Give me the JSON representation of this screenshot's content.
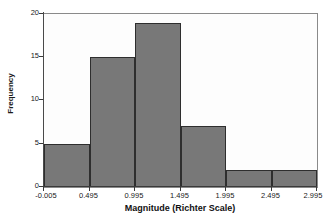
{
  "chart_data": {
    "type": "bar",
    "title": "",
    "xlabel": "Magnitude (Richter Scale)",
    "ylabel": "Frequency",
    "categories": [
      "-0.005 to 0.495",
      "0.495 to 0.995",
      "0.995 to 1.495",
      "1.495 to 1.995",
      "1.995 to 2.495",
      "2.495 to 2.995"
    ],
    "values": [
      5,
      15,
      19,
      7,
      2,
      2
    ],
    "bin_edges": [
      -0.005,
      0.495,
      0.995,
      1.495,
      1.995,
      2.495,
      2.995
    ],
    "bin_width": 0.5,
    "xlim": [
      -0.005,
      2.995
    ],
    "ylim": [
      0,
      20
    ],
    "x_tick_labels": [
      "-0.005",
      "0.495",
      "0.995",
      "1.495",
      "1.995",
      "2.495",
      "2.995"
    ],
    "x_tick_values": [
      -0.005,
      0.495,
      0.995,
      1.495,
      1.995,
      2.495,
      2.995
    ],
    "y_tick_labels": [
      "0",
      "5",
      "10",
      "15",
      "20"
    ],
    "y_tick_values": [
      0,
      5,
      10,
      15,
      20
    ],
    "grid": false,
    "legend": false,
    "legend_position": "none",
    "bar_fill_color": "#787878",
    "bar_edge_color": "#2e2e2e",
    "plot_background_color": "#fdfdfd",
    "axis_color": "#3a3a3a",
    "text_color": "#1a1a1a"
  }
}
